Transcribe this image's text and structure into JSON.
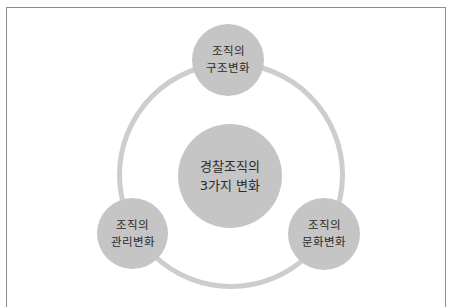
{
  "diagram": {
    "type": "hub-and-cycle",
    "center": {
      "lines": [
        "경찰조직의",
        "3가지 변화"
      ]
    },
    "nodes": [
      {
        "position": "top",
        "lines": [
          "조직의",
          "구조변화"
        ]
      },
      {
        "position": "bottom-left",
        "lines": [
          "조직의",
          "관리변화"
        ]
      },
      {
        "position": "bottom-right",
        "lines": [
          "조직의",
          "문화변화"
        ]
      }
    ],
    "colors": {
      "circle_fill": "#c5c5c5",
      "ring": "#cdcdcd",
      "text": "#2b2b2b",
      "frame": "#8c8c8c",
      "background": "#ffffff"
    }
  }
}
